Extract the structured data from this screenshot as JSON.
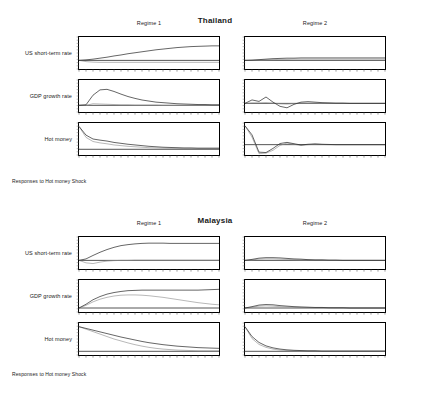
{
  "figures": [
    {
      "id": "thailand",
      "title": "Thailand",
      "caption": "Responses to Hot money Shock",
      "columns": [
        {
          "label": "Regime 1"
        },
        {
          "label": "Regime 2"
        }
      ],
      "rows": [
        {
          "label": "US short-term rate"
        },
        {
          "label": "GDP growth rate"
        },
        {
          "label": "Hot money"
        }
      ]
    },
    {
      "id": "malaysia",
      "title": "Malaysia",
      "caption": "Responses to Hot money Shock",
      "columns": [
        {
          "label": "Regime 1"
        },
        {
          "label": "Regime 2"
        }
      ],
      "rows": [
        {
          "label": "US short-term rate"
        },
        {
          "label": "GDP growth rate"
        },
        {
          "label": "Hot money"
        }
      ]
    }
  ],
  "chart_data": [
    {
      "type": "line",
      "title": "Thailand",
      "subtitle": "Responses to Hot money Shock",
      "panel": "Regime 1 / US short-term rate",
      "xlabel": "",
      "ylabel": "US short-term rate",
      "grid": false,
      "legend": "none",
      "x": [
        0,
        1,
        2,
        3,
        4,
        5,
        6,
        7,
        8,
        9,
        10,
        11,
        12,
        13,
        14,
        15,
        16,
        17,
        18,
        19,
        20
      ],
      "xlim": [
        0,
        20
      ],
      "ylim": [
        -0.35,
        0.95
      ],
      "series": [
        {
          "name": "response",
          "values": [
            0.0,
            0.02,
            0.05,
            0.09,
            0.13,
            0.18,
            0.22,
            0.27,
            0.31,
            0.35,
            0.39,
            0.43,
            0.46,
            0.49,
            0.52,
            0.54,
            0.56,
            0.57,
            0.58,
            0.59,
            0.59
          ]
        },
        {
          "name": "band",
          "values": [
            0.0,
            -0.05,
            -0.07,
            -0.08,
            -0.08,
            -0.08,
            -0.08,
            -0.08,
            -0.08,
            -0.08,
            -0.08,
            -0.08,
            -0.08,
            -0.08,
            -0.08,
            -0.08,
            -0.08,
            -0.08,
            -0.08,
            -0.08,
            -0.08
          ]
        }
      ]
    },
    {
      "type": "line",
      "title": "Thailand",
      "panel": "Regime 2 / US short-term rate",
      "ylabel": "US short-term rate",
      "grid": false,
      "x": [
        0,
        1,
        2,
        3,
        4,
        5,
        6,
        7,
        8,
        9,
        10,
        11,
        12,
        13,
        14,
        15,
        16,
        17,
        18,
        19,
        20
      ],
      "xlim": [
        0,
        20
      ],
      "ylim": [
        -0.35,
        0.95
      ],
      "series": [
        {
          "name": "response",
          "values": [
            0.0,
            0.01,
            0.03,
            0.05,
            0.07,
            0.08,
            0.09,
            0.09,
            0.1,
            0.1,
            0.1,
            0.1,
            0.1,
            0.1,
            0.1,
            0.1,
            0.1,
            0.1,
            0.1,
            0.1,
            0.1
          ]
        },
        {
          "name": "band",
          "values": [
            0.0,
            0.0,
            0.01,
            0.02,
            0.03,
            0.04,
            0.04,
            0.05,
            0.05,
            0.05,
            0.05,
            0.05,
            0.05,
            0.05,
            0.05,
            0.05,
            0.05,
            0.05,
            0.05,
            0.05,
            0.05
          ]
        }
      ]
    },
    {
      "type": "line",
      "title": "Thailand",
      "panel": "Regime 1 / GDP growth rate",
      "ylabel": "GDP growth rate",
      "grid": false,
      "x": [
        0,
        1,
        2,
        3,
        4,
        5,
        6,
        7,
        8,
        9,
        10,
        11,
        12,
        13,
        14,
        15,
        16,
        17,
        18,
        19,
        20
      ],
      "xlim": [
        0,
        20
      ],
      "ylim": [
        -0.25,
        0.95
      ],
      "series": [
        {
          "name": "response",
          "values": [
            0.0,
            0.02,
            0.38,
            0.58,
            0.6,
            0.52,
            0.42,
            0.33,
            0.26,
            0.2,
            0.16,
            0.12,
            0.1,
            0.08,
            0.06,
            0.05,
            0.04,
            0.03,
            0.03,
            0.02,
            0.02
          ]
        },
        {
          "name": "band",
          "values": [
            0.0,
            0.0,
            0.06,
            0.05,
            0.04,
            0.03,
            0.02,
            0.02,
            0.01,
            0.01,
            0.01,
            0.01,
            0.0,
            0.0,
            0.0,
            0.0,
            0.0,
            0.0,
            0.0,
            0.0,
            0.0
          ]
        }
      ]
    },
    {
      "type": "line",
      "title": "Thailand",
      "panel": "Regime 2 / GDP growth rate",
      "ylabel": "GDP growth rate",
      "grid": false,
      "x": [
        0,
        1,
        2,
        3,
        4,
        5,
        6,
        7,
        8,
        9,
        10,
        11,
        12,
        13,
        14,
        15,
        16,
        17,
        18,
        19,
        20
      ],
      "xlim": [
        0,
        20
      ],
      "ylim": [
        -0.35,
        0.95
      ],
      "series": [
        {
          "name": "response",
          "values": [
            0.0,
            0.14,
            0.08,
            0.26,
            0.05,
            -0.12,
            -0.18,
            -0.04,
            0.05,
            0.07,
            0.05,
            0.03,
            0.02,
            0.01,
            0.01,
            0.0,
            0.0,
            0.0,
            0.0,
            0.0,
            0.0
          ]
        },
        {
          "name": "band",
          "values": [
            0.0,
            0.02,
            0.02,
            0.03,
            0.01,
            -0.02,
            -0.03,
            -0.01,
            0.01,
            0.01,
            0.01,
            0.0,
            0.0,
            0.0,
            0.0,
            0.0,
            0.0,
            0.0,
            0.0,
            0.0,
            0.0
          ]
        }
      ]
    },
    {
      "type": "line",
      "title": "Thailand",
      "panel": "Regime 1 / Hot money",
      "ylabel": "Hot money",
      "grid": false,
      "x": [
        0,
        1,
        2,
        3,
        4,
        5,
        6,
        7,
        8,
        9,
        10,
        11,
        12,
        13,
        14,
        15,
        16,
        17,
        18,
        19,
        20
      ],
      "xlim": [
        0,
        20
      ],
      "ylim": [
        -0.25,
        1.15
      ],
      "series": [
        {
          "name": "response",
          "values": [
            1.0,
            0.62,
            0.45,
            0.4,
            0.36,
            0.3,
            0.26,
            0.22,
            0.19,
            0.16,
            0.13,
            0.11,
            0.09,
            0.08,
            0.07,
            0.06,
            0.06,
            0.05,
            0.05,
            0.05,
            0.05
          ]
        },
        {
          "name": "band",
          "values": [
            1.0,
            0.52,
            0.34,
            0.28,
            0.24,
            0.19,
            0.16,
            0.13,
            0.11,
            0.09,
            0.07,
            0.06,
            0.05,
            0.04,
            0.04,
            0.03,
            0.03,
            0.03,
            0.03,
            0.03,
            0.03
          ]
        }
      ]
    },
    {
      "type": "line",
      "title": "Thailand",
      "panel": "Regime 2 / Hot money",
      "ylabel": "Hot money",
      "grid": false,
      "x": [
        0,
        1,
        2,
        3,
        4,
        5,
        6,
        7,
        8,
        9,
        10,
        11,
        12,
        13,
        14,
        15,
        16,
        17,
        18,
        19,
        20
      ],
      "xlim": [
        0,
        20
      ],
      "ylim": [
        -0.55,
        1.15
      ],
      "series": [
        {
          "name": "response",
          "values": [
            1.0,
            0.52,
            -0.4,
            -0.42,
            -0.2,
            0.06,
            0.12,
            0.05,
            -0.02,
            0.02,
            0.04,
            0.02,
            0.01,
            0.0,
            0.0,
            0.0,
            0.0,
            0.0,
            0.0,
            0.0,
            0.0
          ]
        },
        {
          "name": "band",
          "values": [
            1.0,
            0.4,
            -0.48,
            -0.45,
            -0.3,
            -0.04,
            0.08,
            0.02,
            -0.04,
            0.0,
            0.02,
            0.01,
            0.0,
            0.0,
            0.0,
            0.0,
            0.0,
            0.0,
            0.0,
            0.0,
            0.0
          ]
        }
      ]
    },
    {
      "type": "line",
      "title": "Malaysia",
      "subtitle": "Responses to Hot money Shock",
      "panel": "Regime 1 / US short-term rate",
      "ylabel": "US short-term rate",
      "grid": false,
      "x": [
        0,
        1,
        2,
        3,
        4,
        5,
        6,
        7,
        8,
        9,
        10,
        11,
        12,
        13,
        14,
        15,
        16,
        17,
        18,
        19,
        20
      ],
      "xlim": [
        0,
        20
      ],
      "ylim": [
        -0.35,
        0.95
      ],
      "series": [
        {
          "name": "response",
          "values": [
            0.0,
            0.06,
            0.2,
            0.33,
            0.44,
            0.53,
            0.6,
            0.64,
            0.67,
            0.69,
            0.7,
            0.7,
            0.7,
            0.69,
            0.69,
            0.69,
            0.69,
            0.69,
            0.69,
            0.69,
            0.69
          ]
        },
        {
          "name": "band",
          "values": [
            0.0,
            -0.1,
            -0.13,
            -0.07,
            -0.03,
            -0.01,
            0.0,
            0.0,
            0.01,
            0.01,
            0.01,
            0.01,
            0.01,
            0.01,
            0.01,
            0.01,
            0.01,
            0.01,
            0.01,
            0.01,
            0.01
          ]
        }
      ]
    },
    {
      "type": "line",
      "title": "Malaysia",
      "panel": "Regime 2 / US short-term rate",
      "ylabel": "US short-term rate",
      "grid": false,
      "x": [
        0,
        1,
        2,
        3,
        4,
        5,
        6,
        7,
        8,
        9,
        10,
        11,
        12,
        13,
        14,
        15,
        16,
        17,
        18,
        19,
        20
      ],
      "xlim": [
        0,
        20
      ],
      "ylim": [
        -0.35,
        0.95
      ],
      "series": [
        {
          "name": "response",
          "values": [
            0.0,
            0.04,
            0.09,
            0.11,
            0.11,
            0.1,
            0.08,
            0.06,
            0.05,
            0.03,
            0.02,
            0.02,
            0.01,
            0.01,
            0.0,
            0.0,
            0.0,
            0.0,
            0.0,
            0.0,
            0.0
          ]
        },
        {
          "name": "band",
          "values": [
            0.0,
            0.02,
            0.05,
            0.06,
            0.06,
            0.05,
            0.04,
            0.03,
            0.02,
            0.02,
            0.01,
            0.01,
            0.0,
            0.0,
            0.0,
            0.0,
            0.0,
            0.0,
            0.0,
            0.0,
            0.0
          ]
        }
      ]
    },
    {
      "type": "line",
      "title": "Malaysia",
      "panel": "Regime 1 / GDP growth rate",
      "ylabel": "GDP growth rate",
      "grid": false,
      "x": [
        0,
        1,
        2,
        3,
        4,
        5,
        6,
        7,
        8,
        9,
        10,
        11,
        12,
        13,
        14,
        15,
        16,
        17,
        18,
        19,
        20
      ],
      "xlim": [
        0,
        20
      ],
      "ylim": [
        -0.15,
        1.05
      ],
      "series": [
        {
          "name": "response",
          "values": [
            0.0,
            0.14,
            0.31,
            0.43,
            0.52,
            0.58,
            0.62,
            0.65,
            0.66,
            0.67,
            0.67,
            0.67,
            0.67,
            0.67,
            0.67,
            0.67,
            0.67,
            0.67,
            0.68,
            0.69,
            0.7
          ]
        },
        {
          "name": "band",
          "values": [
            0.0,
            0.1,
            0.23,
            0.33,
            0.4,
            0.45,
            0.48,
            0.49,
            0.49,
            0.48,
            0.46,
            0.43,
            0.4,
            0.36,
            0.32,
            0.28,
            0.24,
            0.2,
            0.17,
            0.14,
            0.12
          ]
        }
      ]
    },
    {
      "type": "line",
      "title": "Malaysia",
      "panel": "Regime 2 / GDP growth rate",
      "ylabel": "GDP growth rate",
      "grid": false,
      "x": [
        0,
        1,
        2,
        3,
        4,
        5,
        6,
        7,
        8,
        9,
        10,
        11,
        12,
        13,
        14,
        15,
        16,
        17,
        18,
        19,
        20
      ],
      "xlim": [
        0,
        20
      ],
      "ylim": [
        -0.15,
        1.05
      ],
      "series": [
        {
          "name": "response",
          "values": [
            0.0,
            0.05,
            0.11,
            0.13,
            0.12,
            0.09,
            0.07,
            0.05,
            0.04,
            0.03,
            0.02,
            0.02,
            0.01,
            0.01,
            0.01,
            0.0,
            0.0,
            0.0,
            0.0,
            0.0,
            0.0
          ]
        },
        {
          "name": "band",
          "values": [
            0.0,
            0.03,
            0.07,
            0.08,
            0.07,
            0.05,
            0.04,
            0.03,
            0.02,
            0.02,
            0.01,
            0.01,
            0.01,
            0.0,
            0.0,
            0.0,
            0.0,
            0.0,
            0.0,
            0.0,
            0.0
          ]
        }
      ]
    },
    {
      "type": "line",
      "title": "Malaysia",
      "panel": "Regime 1 / Hot money",
      "ylabel": "Hot money",
      "grid": false,
      "x": [
        0,
        1,
        2,
        3,
        4,
        5,
        6,
        7,
        8,
        9,
        10,
        11,
        12,
        13,
        14,
        15,
        16,
        17,
        18,
        19,
        20
      ],
      "xlim": [
        0,
        20
      ],
      "ylim": [
        -0.15,
        1.15
      ],
      "series": [
        {
          "name": "response",
          "values": [
            1.0,
            0.93,
            0.86,
            0.79,
            0.72,
            0.65,
            0.58,
            0.52,
            0.46,
            0.4,
            0.35,
            0.31,
            0.27,
            0.24,
            0.21,
            0.19,
            0.17,
            0.15,
            0.14,
            0.13,
            0.12
          ]
        },
        {
          "name": "band",
          "values": [
            1.0,
            0.9,
            0.8,
            0.7,
            0.6,
            0.5,
            0.42,
            0.34,
            0.27,
            0.21,
            0.16,
            0.12,
            0.09,
            0.07,
            0.05,
            0.04,
            0.03,
            0.02,
            0.02,
            0.02,
            0.02
          ]
        }
      ]
    },
    {
      "type": "line",
      "title": "Malaysia",
      "panel": "Regime 2 / Hot money",
      "ylabel": "Hot money",
      "grid": false,
      "x": [
        0,
        1,
        2,
        3,
        4,
        5,
        6,
        7,
        8,
        9,
        10,
        11,
        12,
        13,
        14,
        15,
        16,
        17,
        18,
        19,
        20
      ],
      "xlim": [
        0,
        20
      ],
      "ylim": [
        -0.15,
        1.15
      ],
      "series": [
        {
          "name": "response",
          "values": [
            1.0,
            0.6,
            0.36,
            0.22,
            0.14,
            0.09,
            0.06,
            0.04,
            0.03,
            0.02,
            0.02,
            0.01,
            0.01,
            0.01,
            0.01,
            0.01,
            0.01,
            0.01,
            0.01,
            0.01,
            0.01
          ]
        },
        {
          "name": "band",
          "values": [
            1.0,
            0.52,
            0.28,
            0.16,
            0.09,
            0.05,
            0.03,
            0.02,
            0.01,
            0.01,
            0.01,
            0.0,
            0.0,
            0.0,
            0.0,
            0.0,
            0.0,
            0.0,
            0.0,
            0.0,
            0.0
          ]
        }
      ]
    }
  ],
  "axis": {
    "x_tick_count": 21,
    "y_tick_count": 11
  }
}
